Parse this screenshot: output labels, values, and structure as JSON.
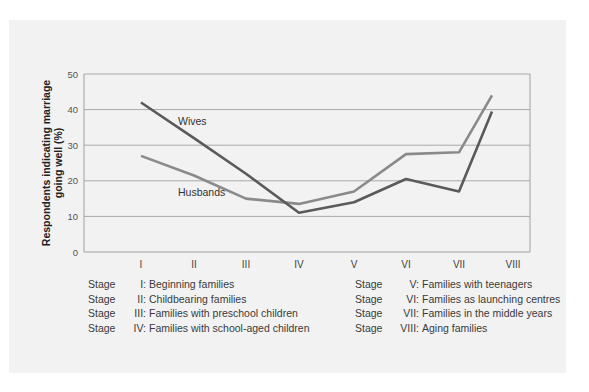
{
  "chart_data": {
    "type": "line",
    "title": "",
    "xlabel": "",
    "ylabel": "Respondents indicating marriage going well (%)",
    "ylabel_lines": [
      "Respondents indicating marriage",
      "going well (%)"
    ],
    "ylim": [
      0,
      50
    ],
    "yticks": [
      0,
      10,
      20,
      30,
      40,
      50
    ],
    "categories": [
      "I",
      "II",
      "III",
      "IV",
      "V",
      "VI",
      "VII",
      "VIII"
    ],
    "grid": true,
    "legend_position": "inline labels",
    "series": [
      {
        "name": "Wives",
        "color": "#5a5a5a",
        "values": [
          42,
          32,
          22,
          11,
          14,
          20.5,
          17,
          39.5
        ]
      },
      {
        "name": "Husbands",
        "color": "#8a8a8a",
        "values": [
          27,
          21.5,
          15,
          13.5,
          17,
          27.5,
          28,
          44
        ]
      }
    ],
    "annotations": [
      "Wives",
      "Husbands"
    ]
  },
  "legend": {
    "left": [
      {
        "stage": "Stage",
        "num": "I:",
        "label": "Beginning families"
      },
      {
        "stage": "Stage",
        "num": "II:",
        "label": "Childbearing families"
      },
      {
        "stage": "Stage",
        "num": "III:",
        "label": "Families with preschool children"
      },
      {
        "stage": "Stage",
        "num": "IV:",
        "label": "Families with school-aged children"
      }
    ],
    "right": [
      {
        "stage": "Stage",
        "num": "V:",
        "label": "Families with teenagers"
      },
      {
        "stage": "Stage",
        "num": "VI:",
        "label": "Families as launching centres"
      },
      {
        "stage": "Stage",
        "num": "VII:",
        "label": "Families in the middle years"
      },
      {
        "stage": "Stage",
        "num": "VIII:",
        "label": "Aging families"
      }
    ]
  }
}
